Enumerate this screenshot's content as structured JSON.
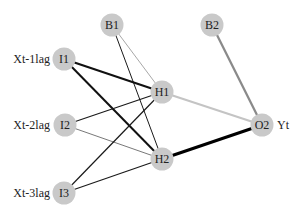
{
  "diagram": {
    "type": "neural-network",
    "layers": [
      "input",
      "hidden",
      "output"
    ],
    "node_color": "#c9c9c9",
    "nodes": {
      "B1": {
        "label": "B1",
        "role": "bias"
      },
      "B2": {
        "label": "B2",
        "role": "bias"
      },
      "I1": {
        "label": "I1",
        "role": "input",
        "variable": "Xt-1lag"
      },
      "I2": {
        "label": "I2",
        "role": "input",
        "variable": "Xt-2lag"
      },
      "I3": {
        "label": "I3",
        "role": "input",
        "variable": "Xt-3lag"
      },
      "H1": {
        "label": "H1",
        "role": "hidden"
      },
      "H2": {
        "label": "H2",
        "role": "hidden"
      },
      "O2": {
        "label": "O2",
        "role": "output",
        "variable": "Yt"
      }
    },
    "edges": [
      {
        "from": "B1",
        "to": "H1",
        "color": "#a8a8a8",
        "width": "1"
      },
      {
        "from": "B1",
        "to": "H2",
        "color": "#1a1a1a",
        "width": "1"
      },
      {
        "from": "I1",
        "to": "H1",
        "color": "#111111",
        "width": "2.2"
      },
      {
        "from": "I1",
        "to": "H2",
        "color": "#111111",
        "width": "2"
      },
      {
        "from": "I2",
        "to": "H1",
        "color": "#1a1a1a",
        "width": "1.2"
      },
      {
        "from": "I2",
        "to": "H2",
        "color": "#555555",
        "width": "0.8"
      },
      {
        "from": "I3",
        "to": "H1",
        "color": "#1a1a1a",
        "width": "1.2"
      },
      {
        "from": "I3",
        "to": "H2",
        "color": "#1a1a1a",
        "width": "1.2"
      },
      {
        "from": "H1",
        "to": "O2",
        "color": "#c4c4c4",
        "width": "2.2"
      },
      {
        "from": "H2",
        "to": "O2",
        "color": "#000000",
        "width": "3"
      },
      {
        "from": "B2",
        "to": "O2",
        "color": "#8a8a8a",
        "width": "2.2"
      }
    ]
  }
}
